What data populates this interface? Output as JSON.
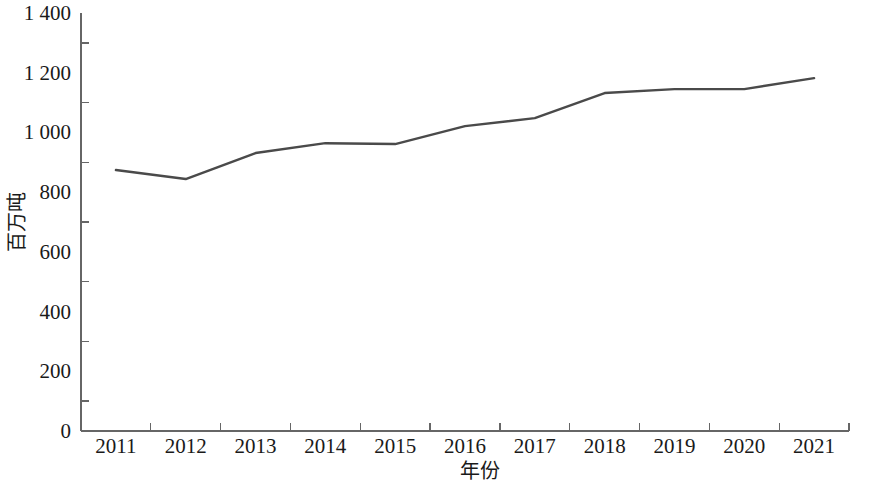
{
  "chart_data": {
    "type": "line",
    "title": "",
    "subtitle": "",
    "xlabel": "年份",
    "ylabel": "百万吨",
    "categories": [
      "2011",
      "2012",
      "2013",
      "2014",
      "2015",
      "2016",
      "2017",
      "2018",
      "2019",
      "2020",
      "2021"
    ],
    "x": [
      2011,
      2012,
      2013,
      2014,
      2015,
      2016,
      2017,
      2018,
      2019,
      2020,
      2021
    ],
    "series": [
      {
        "name": "百万吨",
        "values": [
          874,
          844,
          931,
          964,
          961,
          1021,
          1048,
          1132,
          1145,
          1145,
          1182
        ],
        "color": "#4a4a4a"
      }
    ],
    "values": [
      874,
      844,
      931,
      964,
      961,
      1021,
      1048,
      1132,
      1145,
      1145,
      1182
    ],
    "ylim": [
      0,
      1400
    ],
    "ytick_values": [
      0,
      200,
      400,
      600,
      800,
      1000,
      1200,
      1400
    ],
    "ytick_labels": [
      "0",
      "200",
      "400",
      "600",
      "800",
      "1 000",
      "1 200",
      "1 400"
    ],
    "yminor_tick_values": [
      100,
      300,
      500,
      700,
      900,
      1100,
      1300
    ],
    "xtick_labels": [
      "2011",
      "2012",
      "2013",
      "2014",
      "2015",
      "2016",
      "2017",
      "2018",
      "2019",
      "2020",
      "2021"
    ],
    "grid": false,
    "legend": false,
    "legend_position": "none",
    "annotations": []
  },
  "colors": {
    "line": "#4a4a4a",
    "axis": "#666666",
    "text": "#1a1a1a",
    "background": "#ffffff"
  }
}
